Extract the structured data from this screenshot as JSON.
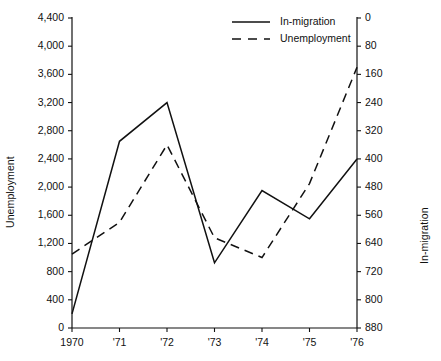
{
  "chart_data": {
    "type": "line",
    "title": "",
    "xlabel": "",
    "x": [
      "1970",
      "'71",
      "'72",
      "'73",
      "'74",
      "'75",
      "'76"
    ],
    "xtick_labels": [
      "1970",
      "'71",
      "'72",
      "'73",
      "'74",
      "'75",
      "'76"
    ],
    "grid": false,
    "legend_position": "top-right-inside",
    "axes": {
      "left": {
        "label": "Unemployment",
        "ylim": [
          0,
          4400
        ],
        "tick_step": 400,
        "inverted": false,
        "ticks": [
          0,
          400,
          800,
          1200,
          1600,
          2000,
          2400,
          2800,
          3200,
          3600,
          4000,
          4400
        ],
        "tick_labels": [
          "0",
          "400",
          "800",
          "1,200",
          "1,600",
          "2,000",
          "2,400",
          "2,800",
          "3,200",
          "3,600",
          "4,000",
          "4,400"
        ]
      },
      "right": {
        "label": "In-migration",
        "ylim": [
          0,
          880
        ],
        "tick_step": 80,
        "inverted": true,
        "ticks": [
          0,
          80,
          160,
          240,
          320,
          400,
          480,
          560,
          640,
          720,
          800,
          880
        ],
        "tick_labels": [
          "0",
          "80",
          "160",
          "240",
          "320",
          "400",
          "480",
          "560",
          "640",
          "720",
          "800",
          "880"
        ]
      }
    },
    "series": [
      {
        "name": "In-migration",
        "style": "solid",
        "axis": "right",
        "color": "#111111",
        "values": [
          840,
          350,
          240,
          695,
          490,
          570,
          400
        ],
        "values_left_scale_equivalent": [
          200,
          2680,
          3200,
          920,
          1950,
          1560,
          2380
        ]
      },
      {
        "name": "Unemployment",
        "style": "dashed",
        "axis": "left",
        "color": "#111111",
        "values": [
          1050,
          1500,
          2600,
          1280,
          1000,
          2050,
          3700
        ]
      }
    ],
    "legend": [
      {
        "label": "In-migration",
        "style": "solid"
      },
      {
        "label": "Unemployment",
        "style": "dashed"
      }
    ]
  }
}
